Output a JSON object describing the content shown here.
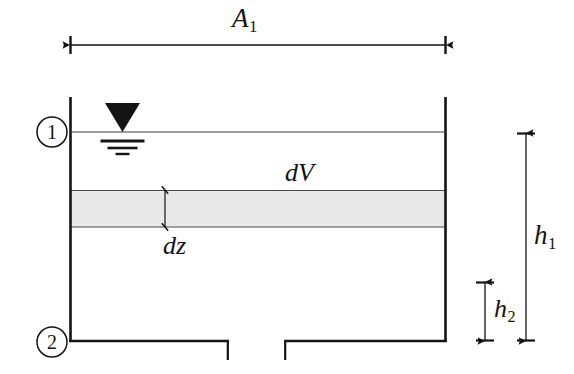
{
  "figure": {
    "background_color": "#ffffff",
    "line_color": "#141414",
    "fill_color": "#e8e8e8"
  },
  "labels": {
    "area_top": {
      "symbol": "A",
      "subscript": "1",
      "name": "tank cross-sectional area"
    },
    "differential_volume": {
      "symbol": "dV",
      "subscript": "",
      "name": "differential volume element"
    },
    "differential_height": {
      "symbol": "dz",
      "subscript": "",
      "name": "differential height"
    },
    "head_total": {
      "symbol": "h",
      "subscript": "1",
      "name": "total head from surface to outlet"
    },
    "head_lower": {
      "symbol": "h",
      "subscript": "2",
      "name": "lower head segment"
    }
  },
  "stations": {
    "station_one": {
      "text": "1",
      "name": "free surface station"
    },
    "station_two": {
      "text": "2",
      "name": "outlet station"
    }
  },
  "geometry": {
    "tank_left_x": 70,
    "tank_right_x": 446,
    "tank_top_y": 97,
    "tank_bottom_y": 341,
    "water_surface_y": 132,
    "band_top_y": 190,
    "band_bottom_y": 227,
    "outlet_left_x": 228,
    "outlet_right_x": 285,
    "outlet_stub_depth": 18,
    "dim_a1_y": 45,
    "dim_a1_left_x": 70,
    "dim_a1_right_x": 446,
    "dim_dz_x": 165,
    "dim_h1_x": 526,
    "dim_h1_top_y": 133,
    "dim_h1_bottom_y": 341,
    "dim_h2_x": 485,
    "dim_h2_top_y": 282,
    "dim_h2_bottom_y": 341
  },
  "water_symbol": {
    "name": "free-surface-level-symbol",
    "triangle_left_x": 105,
    "triangle_right_x": 140,
    "triangle_top_y": 103,
    "triangle_apex_y": 132,
    "bars": [
      {
        "y": 141,
        "half_width": 22
      },
      {
        "y": 148,
        "half_width": 15
      },
      {
        "y": 154,
        "half_width": 7
      }
    ]
  }
}
